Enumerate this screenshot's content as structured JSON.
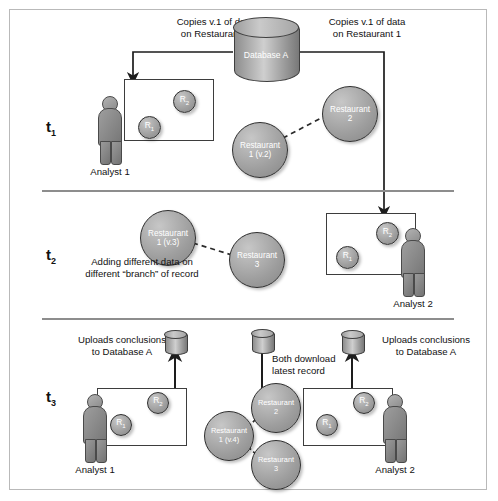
{
  "diagram": {
    "timesteps": [
      {
        "label": "t",
        "sub": "1"
      },
      {
        "label": "t",
        "sub": "2"
      },
      {
        "label": "t",
        "sub": "3"
      }
    ],
    "database_label": "Database A",
    "captions": {
      "copies_left": "Copies v.1 of data\non Restaurant 1",
      "copies_left_line1": "Copies v.1 of data",
      "copies_left_line2": "on Restaurant 1",
      "copies_right_line1": "Copies v.1 of data",
      "copies_right_line2": "on Restaurant 1",
      "branch_line1": "Adding different data on",
      "branch_line2": "different “branch” of record",
      "uploads_left_line1": "Uploads conclusions",
      "uploads_left_line2": "to Database A",
      "uploads_right_line1": "Uploads conclusions",
      "uploads_right_line2": "to Database A",
      "download_line1": "Both download",
      "download_line2": "latest record"
    },
    "analysts": {
      "analyst1": "Analyst 1",
      "analyst2": "Analyst 2"
    },
    "screen_nodes": {
      "r1": "R",
      "r1_sub": "1",
      "r2": "R",
      "r2_sub": "2"
    },
    "records": {
      "t1": [
        {
          "line1": "Restaurant",
          "line2": "1 (v.2)"
        },
        {
          "line1": "Restaurant",
          "line2": "2"
        }
      ],
      "t2": [
        {
          "line1": "Restaurant",
          "line2": "1 (v.3)"
        },
        {
          "line1": "Restaurant",
          "line2": "3"
        }
      ],
      "t3": [
        {
          "line1": "Restaurant",
          "line2": "1 (v.4)"
        },
        {
          "line1": "Restaurant",
          "line2": "2"
        },
        {
          "line1": "Restaurant",
          "line2": "3"
        }
      ]
    },
    "colors": {
      "frame_border": "#b9b9b9",
      "divider": "#8d8d8d",
      "node_fill": "#9e9e9e",
      "screen_border": "#3d3d3d",
      "text": "#111111",
      "node_text": "#ffffff"
    }
  }
}
